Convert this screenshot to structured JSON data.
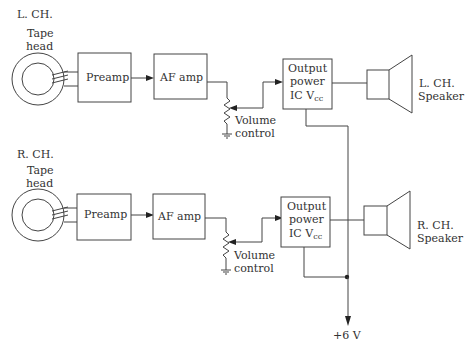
{
  "diagram": {
    "type": "stereo tape player block diagram",
    "left_channel": {
      "channel_label": "L. CH.",
      "tape_head_label_1": "Tape",
      "tape_head_label_2": "head",
      "preamp_label": "Preamp",
      "af_amp_label": "AF amp",
      "volume_label_1": "Volume",
      "volume_label_2": "control",
      "output_ic_label_1": "Output",
      "output_ic_label_2": "power",
      "output_ic_label_3": "IC V",
      "output_ic_sub": "cc",
      "speaker_label_1": "L. CH.",
      "speaker_label_2": "Speaker"
    },
    "right_channel": {
      "channel_label": "R. CH.",
      "tape_head_label_1": "Tape",
      "tape_head_label_2": "head",
      "preamp_label": "Preamp",
      "af_amp_label": "AF amp",
      "volume_label_1": "Volume",
      "volume_label_2": "control",
      "output_ic_label_1": "Output",
      "output_ic_label_2": "power",
      "output_ic_label_3": "IC V",
      "output_ic_sub": "cc",
      "speaker_label_1": "R. CH.",
      "speaker_label_2": "Speaker"
    },
    "supply_label": "+6 V",
    "colors": {
      "line": "#444444",
      "text": "#333333",
      "background": "#ffffff"
    }
  }
}
